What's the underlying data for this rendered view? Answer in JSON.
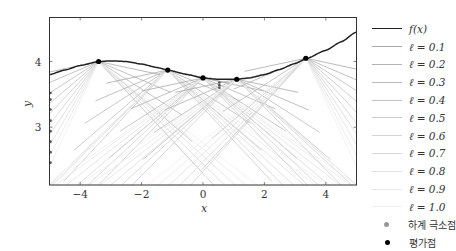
{
  "chart_data": {
    "type": "line",
    "title": "",
    "xlabel": "x",
    "ylabel": "y",
    "xlim": [
      -5,
      5
    ],
    "ylim": [
      2.12,
      4.67
    ],
    "xticks": [
      -4,
      -2,
      0,
      2,
      4
    ],
    "xtick_labels": [
      "−4",
      "−2",
      "0",
      "2",
      "4"
    ],
    "yticks": [
      3,
      4
    ],
    "ytick_labels": [
      "3",
      "4"
    ],
    "grid": false,
    "legend_position": "outside right",
    "series": [
      {
        "name": "f(x)",
        "color": "#222222",
        "x": [
          -5,
          -4.5,
          -4,
          -3.4,
          -3,
          -2.5,
          -2,
          -1.5,
          -1.15,
          -0.5,
          0,
          0.5,
          1.1,
          1.5,
          2,
          2.5,
          3,
          3.35,
          4,
          4.5,
          5
        ],
        "y": [
          3.8,
          3.87,
          3.94,
          4.0,
          4.01,
          4.0,
          3.96,
          3.91,
          3.87,
          3.8,
          3.75,
          3.73,
          3.73,
          3.75,
          3.8,
          3.88,
          3.97,
          4.04,
          4.17,
          4.3,
          4.45
        ]
      }
    ],
    "lower_bounds": [
      {
        "name": "ℓ = 0.1",
        "color": "#aaaaaa"
      },
      {
        "name": "ℓ = 0.2",
        "color": "#b3b3b3"
      },
      {
        "name": "ℓ = 0.3",
        "color": "#bbbbbb"
      },
      {
        "name": "ℓ = 0.4",
        "color": "#c3c3c3"
      },
      {
        "name": "ℓ = 0.5",
        "color": "#cbcbcb"
      },
      {
        "name": "ℓ = 0.6",
        "color": "#d3d3d3"
      },
      {
        "name": "ℓ = 0.7",
        "color": "#dadada"
      },
      {
        "name": "ℓ = 0.8",
        "color": "#e1e1e1"
      },
      {
        "name": "ℓ = 0.9",
        "color": "#e8e8e8"
      },
      {
        "name": "ℓ = 1.0",
        "color": "#efefef"
      }
    ],
    "evaluation_points": {
      "name": "평가점",
      "color": "#000000",
      "x": [
        -3.4,
        -1.15,
        0.0,
        1.1,
        3.35
      ],
      "y": [
        4.0,
        3.87,
        3.75,
        3.73,
        4.05
      ]
    },
    "lower_bound_minima": {
      "name": "하계 극소점",
      "color": "#888888",
      "x": [
        -5,
        -5,
        -5,
        -5,
        -5,
        -5,
        -5,
        -5,
        0.5,
        0.5,
        0.5
      ],
      "y": [
        3.52,
        3.42,
        3.27,
        3.1,
        2.94,
        2.78,
        2.62,
        2.46,
        3.68,
        3.64,
        3.6
      ]
    }
  },
  "legend": {
    "items": [
      {
        "label": "f(x)",
        "kind": "line",
        "color": "#222222",
        "width": 1.6
      },
      {
        "label": "ℓ = 0.1",
        "kind": "line",
        "color": "#aaaaaa"
      },
      {
        "label": "ℓ = 0.2",
        "kind": "line",
        "color": "#b3b3b3"
      },
      {
        "label": "ℓ = 0.3",
        "kind": "line",
        "color": "#bbbbbb"
      },
      {
        "label": "ℓ = 0.4",
        "kind": "line",
        "color": "#c3c3c3"
      },
      {
        "label": "ℓ = 0.5",
        "kind": "line",
        "color": "#cbcbcb"
      },
      {
        "label": "ℓ = 0.6",
        "kind": "line",
        "color": "#d3d3d3"
      },
      {
        "label": "ℓ = 0.7",
        "kind": "line",
        "color": "#dadada"
      },
      {
        "label": "ℓ = 0.8",
        "kind": "line",
        "color": "#e1e1e1"
      },
      {
        "label": "ℓ = 0.9",
        "kind": "line",
        "color": "#e8e8e8"
      },
      {
        "label": "ℓ = 1.0",
        "kind": "line",
        "color": "#efefef"
      },
      {
        "label": "하계 극소점",
        "kind": "marker",
        "color": "#999999"
      },
      {
        "label": "평가점",
        "kind": "marker",
        "color": "#000000"
      }
    ]
  },
  "axes": {
    "xlabel": "x",
    "ylabel": "y"
  }
}
